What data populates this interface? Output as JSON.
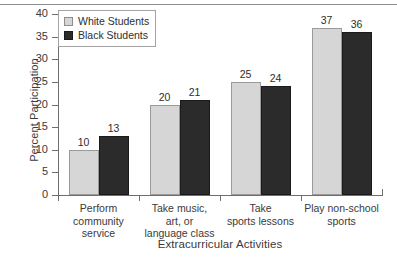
{
  "chart_data": {
    "type": "bar",
    "title": "",
    "xlabel": "Extracurricular Activities",
    "ylabel": "Percent Participation",
    "ylim": [
      0,
      40
    ],
    "ytick_values": [
      0,
      5,
      10,
      15,
      20,
      25,
      30,
      35,
      40
    ],
    "ytick_labels": [
      "0",
      "5",
      "10",
      "15",
      "20",
      "25",
      "30",
      "35",
      "40"
    ],
    "grid": false,
    "legend_position": "top-left",
    "categories": [
      "Perform\ncommunity\nservice",
      "Take music,\nart, or\nlanguage class",
      "Take\nsports lessons",
      "Play non-school\nsports"
    ],
    "series": [
      {
        "name": "White Students",
        "color": "#d6d6d6",
        "values": [
          10,
          20,
          25,
          37
        ],
        "labels": [
          "10",
          "20",
          "25",
          "37"
        ]
      },
      {
        "name": "Black Students",
        "color": "#2b2b2b",
        "values": [
          13,
          21,
          24,
          36
        ],
        "labels": [
          "13",
          "21",
          "24",
          "36"
        ]
      }
    ]
  },
  "legend": {
    "items": [
      {
        "label": "White Students",
        "swatch": "white"
      },
      {
        "label": "Black Students",
        "swatch": "black"
      }
    ]
  },
  "axes": {
    "y_title": "Percent Participation",
    "x_title": "Extracurricular Activities"
  }
}
